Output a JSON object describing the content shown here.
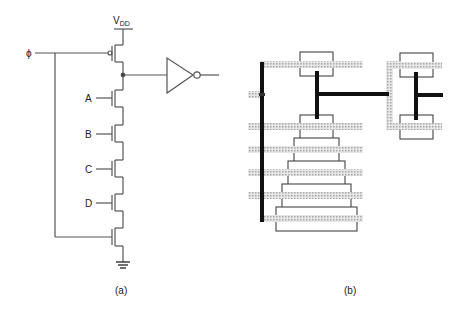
{
  "figure": {
    "panel_a": {
      "caption": "(a)",
      "supply_label": "V",
      "supply_subscript": "DD",
      "clock_label": "ϕ",
      "inputs": [
        "A",
        "B",
        "C",
        "D"
      ],
      "components": [
        "pmos-precharge",
        "nmos-A",
        "nmos-B",
        "nmos-C",
        "nmos-D",
        "nmos-evaluate",
        "inverter",
        "ground"
      ]
    },
    "panel_b": {
      "caption": "(b)",
      "description": "stick/layout diagram with diffusion boxes, polysilicon strips and metal wires"
    }
  },
  "colors": {
    "wire": "#555555",
    "metal": "#111111",
    "poly": "#bdbdbd",
    "background": "#ffffff"
  }
}
